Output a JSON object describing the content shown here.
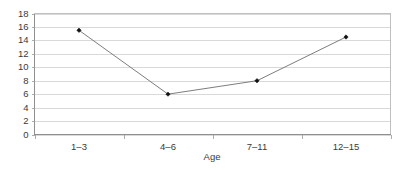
{
  "chart_data": {
    "type": "line",
    "title": "",
    "subtitle": "",
    "xlabel": "Age",
    "ylabel": "",
    "categories": [
      "1–3",
      "4–6",
      "7–11",
      "12–15"
    ],
    "values": [
      15.5,
      6,
      8,
      14.5
    ],
    "series": [
      {
        "name": "",
        "values": [
          15.5,
          6,
          8,
          14.5
        ]
      }
    ],
    "ylim": [
      0,
      18
    ],
    "ytick_step": 2,
    "ytick_labels": [
      "0",
      "2",
      "4",
      "6",
      "8",
      "10",
      "12",
      "14",
      "16",
      "18"
    ],
    "ytick_values": [
      0,
      2,
      4,
      6,
      8,
      10,
      12,
      14,
      16,
      18
    ],
    "xtick_labels": [
      "1–3",
      "4–6",
      "7–11",
      "12–15"
    ],
    "grid": "horizontal",
    "legend": "none",
    "marker": "diamond",
    "colors": {
      "line": "#6e6e6e",
      "marker": "#111111",
      "gridline": "#c9c9c9",
      "axis": "#8a8a8a",
      "plot_border": "#b0b0b0",
      "text": "#3a3a3a",
      "background": "#ffffff"
    }
  }
}
